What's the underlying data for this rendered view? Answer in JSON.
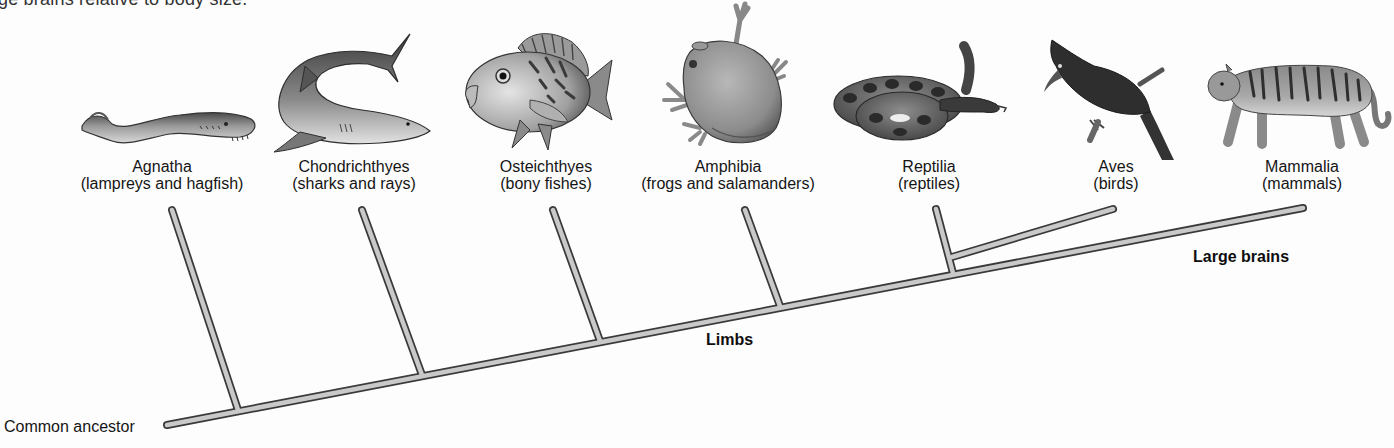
{
  "caption_fragment": "ge brains relative to body size.",
  "taxa": [
    {
      "name": "Agnatha",
      "common": "(lampreys and hagfish)",
      "icon": "lamprey-illustration"
    },
    {
      "name": "Chondrichthyes",
      "common": "(sharks and rays)",
      "icon": "shark-illustration"
    },
    {
      "name": "Osteichthyes",
      "common": "(bony fishes)",
      "icon": "bony-fish-illustration"
    },
    {
      "name": "Amphibia",
      "common": "(frogs and salamanders)",
      "icon": "frog-illustration"
    },
    {
      "name": "Reptilia",
      "common": "(reptiles)",
      "icon": "snake-illustration"
    },
    {
      "name": "Aves",
      "common": "(birds)",
      "icon": "bird-illustration"
    },
    {
      "name": "Mammalia",
      "common": "(mammals)",
      "icon": "tiger-illustration"
    }
  ],
  "traits": {
    "limbs": "Limbs",
    "large_brains": "Large brains"
  },
  "root_label": "Common ancestor",
  "colors": {
    "branch_fill": "#c9c9c9",
    "branch_outline": "#3a3a3a",
    "text": "#151515"
  }
}
